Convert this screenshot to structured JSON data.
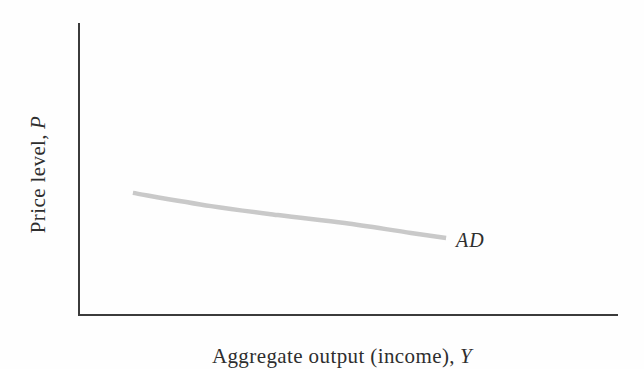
{
  "figure": {
    "y_axis_label": {
      "text": "Price level,",
      "symbol": "P"
    },
    "x_axis_label": {
      "text": "Aggregate output (income),",
      "symbol": "Y"
    },
    "curve_label": "AD"
  },
  "colors": {
    "axis": "#3b3b3b",
    "curve": "#c9c9c9",
    "text": "#2e2e2e",
    "background": "#fefefe"
  },
  "chart_data": {
    "type": "line",
    "title": "",
    "xlabel": "Aggregate output (income), Y",
    "ylabel": "Price level, P",
    "axis_numeric_labels": false,
    "grid": false,
    "legend": "none (curve labeled inline as AD)",
    "series": [
      {
        "name": "AD",
        "color": "#c9c9c9",
        "stroke_width": 4.5,
        "description": "Downward-sloping, slightly convex aggregate demand curve; qualitative (no numeric scale). Points given as fractions of the axis frame (x: 0=origin, 1=right end; y: 0=x-axis, 1=top of y-axis).",
        "points_axis_fraction": [
          {
            "x": 0.1,
            "y": 0.418
          },
          {
            "x": 0.245,
            "y": 0.373
          },
          {
            "x": 0.369,
            "y": 0.342
          },
          {
            "x": 0.493,
            "y": 0.315
          },
          {
            "x": 0.616,
            "y": 0.281
          },
          {
            "x": 0.681,
            "y": 0.264
          }
        ]
      }
    ]
  }
}
